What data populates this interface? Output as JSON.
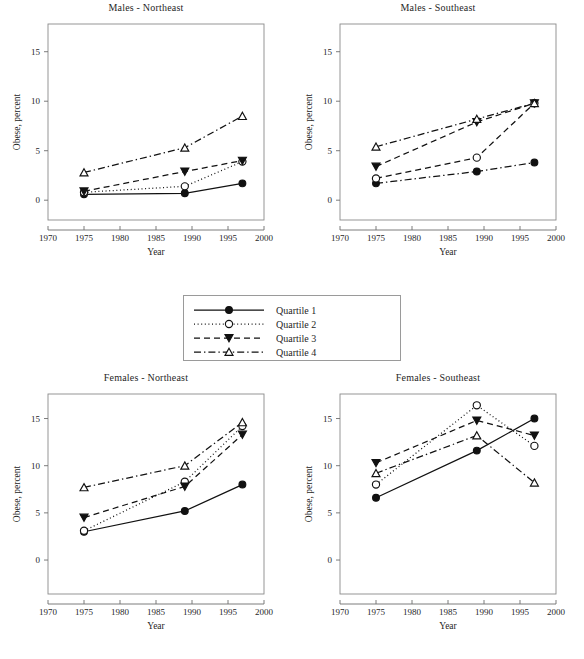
{
  "figure": {
    "width": 584,
    "height": 659,
    "background": "#ffffff",
    "ink_color": "#111111",
    "axis_color": "#6e6e6e"
  },
  "legend": {
    "name": "legend-box",
    "entries": [
      {
        "label": "Quartile 1",
        "marker": "filled-circle",
        "dash": "solid"
      },
      {
        "label": "Quartile 2",
        "marker": "open-circle",
        "dash": "dotted"
      },
      {
        "label": "Quartile 3",
        "marker": "filled-triangle-down",
        "dash": "dashed"
      },
      {
        "label": "Quartile 4",
        "marker": "open-triangle-up",
        "dash": "dash-dot"
      }
    ]
  },
  "chart_data": [
    {
      "type": "line",
      "title": "Males - Northeast",
      "xlabel": "Year",
      "ylabel": "Obese, percent",
      "xlim": [
        1970,
        2000
      ],
      "ylim": [
        -2.0,
        17.8
      ],
      "xticks": [
        1970,
        1975,
        1980,
        1985,
        1990,
        1995,
        2000
      ],
      "yticks": [
        0,
        5,
        10,
        15
      ],
      "grid": false,
      "x": [
        1975,
        1989,
        1997
      ],
      "series": [
        {
          "name": "Quartile 1",
          "marker": "filled-circle",
          "dash": "solid",
          "values": [
            0.6,
            0.7,
            1.7
          ]
        },
        {
          "name": "Quartile 2",
          "marker": "open-circle",
          "dash": "dotted",
          "values": [
            0.8,
            1.4,
            3.9
          ]
        },
        {
          "name": "Quartile 3",
          "marker": "filled-triangle-down",
          "dash": "dashed",
          "values": [
            0.9,
            2.9,
            4.0
          ]
        },
        {
          "name": "Quartile 4",
          "marker": "open-triangle-up",
          "dash": "dash-dot",
          "values": [
            2.8,
            5.3,
            8.5
          ]
        }
      ]
    },
    {
      "type": "line",
      "title": "Males - Southeast",
      "xlabel": "Year",
      "ylabel": "Obese, percent",
      "xlim": [
        1970,
        2000
      ],
      "ylim": [
        -2.0,
        17.8
      ],
      "xticks": [
        1970,
        1975,
        1980,
        1985,
        1990,
        1995,
        2000
      ],
      "yticks": [
        0,
        5,
        10,
        15
      ],
      "grid": false,
      "x": [
        1975,
        1989,
        1997
      ],
      "series": [
        {
          "name": "Quartile 1",
          "marker": "filled-circle",
          "dash": "dash-dot",
          "values": [
            1.7,
            2.9,
            3.8
          ]
        },
        {
          "name": "Quartile 2",
          "marker": "open-circle",
          "dash": "dashed",
          "values": [
            2.2,
            4.3,
            9.8
          ]
        },
        {
          "name": "Quartile 3",
          "marker": "filled-triangle-down",
          "dash": "dashed",
          "values": [
            3.4,
            7.9,
            9.8
          ]
        },
        {
          "name": "Quartile 4",
          "marker": "open-triangle-up",
          "dash": "dash-dot",
          "values": [
            5.4,
            8.2,
            9.8
          ]
        }
      ]
    },
    {
      "type": "line",
      "title": "Females - Northeast",
      "xlabel": "Year",
      "ylabel": "Obese, percent",
      "xlim": [
        1970,
        2000
      ],
      "ylim": [
        -3.6,
        17.6
      ],
      "xticks": [
        1970,
        1975,
        1980,
        1985,
        1990,
        1995,
        2000
      ],
      "yticks": [
        0,
        5,
        10,
        15
      ],
      "grid": false,
      "x": [
        1975,
        1989,
        1997
      ],
      "series": [
        {
          "name": "Quartile 1",
          "marker": "filled-circle",
          "dash": "solid",
          "values": [
            3.0,
            5.2,
            8.0
          ]
        },
        {
          "name": "Quartile 2",
          "marker": "open-circle",
          "dash": "dotted",
          "values": [
            3.1,
            8.3,
            14.2
          ]
        },
        {
          "name": "Quartile 3",
          "marker": "filled-triangle-down",
          "dash": "dashed",
          "values": [
            4.5,
            7.8,
            13.3
          ]
        },
        {
          "name": "Quartile 4",
          "marker": "open-triangle-up",
          "dash": "dash-dot",
          "values": [
            7.7,
            10.0,
            14.6
          ]
        }
      ]
    },
    {
      "type": "line",
      "title": "Females - Southeast",
      "xlabel": "Year",
      "ylabel": "Obese, percent",
      "xlim": [
        1970,
        2000
      ],
      "ylim": [
        -3.6,
        17.6
      ],
      "xticks": [
        1970,
        1975,
        1980,
        1985,
        1990,
        1995,
        2000
      ],
      "yticks": [
        0,
        5,
        10,
        15
      ],
      "grid": false,
      "x": [
        1975,
        1989,
        1997
      ],
      "series": [
        {
          "name": "Quartile 1",
          "marker": "filled-circle",
          "dash": "solid",
          "values": [
            6.6,
            11.6,
            15.0
          ]
        },
        {
          "name": "Quartile 2",
          "marker": "open-circle",
          "dash": "dotted",
          "values": [
            8.0,
            16.4,
            12.1
          ]
        },
        {
          "name": "Quartile 3",
          "marker": "filled-triangle-down",
          "dash": "dashed",
          "values": [
            10.3,
            14.8,
            13.2
          ]
        },
        {
          "name": "Quartile 4",
          "marker": "open-triangle-up",
          "dash": "dash-dot",
          "values": [
            9.2,
            13.2,
            8.2
          ]
        }
      ]
    }
  ],
  "panels": [
    {
      "left": 0,
      "top": 2,
      "width": 292,
      "height": 272,
      "plot": {
        "x": 48,
        "y": 22,
        "w": 216,
        "h": 196
      }
    },
    {
      "left": 292,
      "top": 2,
      "width": 292,
      "height": 272,
      "plot": {
        "x": 48,
        "y": 22,
        "w": 216,
        "h": 196
      }
    },
    {
      "left": 0,
      "top": 372,
      "width": 292,
      "height": 287,
      "plot": {
        "x": 48,
        "y": 22,
        "w": 216,
        "h": 200
      }
    },
    {
      "left": 292,
      "top": 372,
      "width": 292,
      "height": 287,
      "plot": {
        "x": 48,
        "y": 22,
        "w": 216,
        "h": 200
      }
    }
  ],
  "legend_box": {
    "left": 183,
    "top": 295,
    "width": 218,
    "height": 66
  }
}
